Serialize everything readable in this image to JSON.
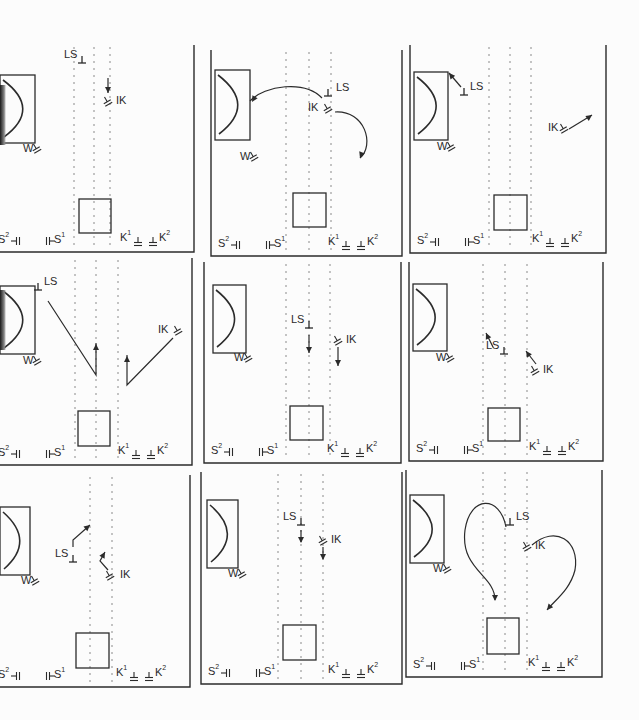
{
  "figure": {
    "panel_order": [
      "A",
      "B",
      "C",
      "D",
      "E",
      "F",
      "G",
      "H",
      "I"
    ]
  },
  "legend_labels": {
    "W": "W",
    "LS": "LS",
    "IK": "IK",
    "S1": "S",
    "S1_sup": "1",
    "S2": "S",
    "S2_sup": "2",
    "K1": "K",
    "K1_sup": "1",
    "K2": "K",
    "K2_sup": "2"
  },
  "panels": [
    {
      "id": "A",
      "x": -10,
      "y": 45,
      "w": 205,
      "h": 208,
      "goal_box": {
        "x": 10,
        "y": 30,
        "w": 35,
        "h": 68
      },
      "square": {
        "x": 89,
        "y": 154,
        "w": 32,
        "h": 34
      },
      "dotted_lines": [
        84,
        104,
        120
      ],
      "LS": {
        "x": 92,
        "y": 18,
        "label_dx": -18
      },
      "IK": {
        "x": 118,
        "y": 58,
        "label_dx": 8
      },
      "W": {
        "x": 35,
        "y": 105
      },
      "paths": [
        "M 118 33 L 118 48"
      ],
      "arrows": [
        [
          118,
          48,
          90
        ]
      ]
    },
    {
      "id": "B",
      "x": 210,
      "y": 50,
      "w": 193,
      "h": 207,
      "goal_box": {
        "x": 5,
        "y": 20,
        "w": 35,
        "h": 70
      },
      "square": {
        "x": 83,
        "y": 143,
        "w": 33,
        "h": 34
      },
      "dotted_lines": [
        76,
        99,
        121
      ],
      "LS": {
        "x": 118,
        "y": 46,
        "label_dx": 8
      },
      "IK": {
        "x": 118,
        "y": 60,
        "label_dx": -20
      },
      "W": {
        "x": 32,
        "y": 108
      },
      "paths": [
        "M 112 48 C 95 30, 55 35, 40 51",
        "M 125 62 C 155 60, 165 95, 150 108"
      ],
      "arrows": [
        [
          42,
          52,
          120
        ],
        [
          150,
          108,
          110
        ]
      ]
    },
    {
      "id": "C",
      "x": 409,
      "y": 45,
      "w": 198,
      "h": 209,
      "goal_box": {
        "x": 5,
        "y": 27,
        "w": 34,
        "h": 68
      },
      "square": {
        "x": 85,
        "y": 150,
        "w": 33,
        "h": 35
      },
      "dotted_lines": [
        80,
        101,
        122
      ],
      "LS": {
        "x": 55,
        "y": 50,
        "label_dx": 6
      },
      "IK": {
        "x": 155,
        "y": 85,
        "label_dx": -16
      },
      "W": {
        "x": 30,
        "y": 103
      },
      "paths": [
        "M 52 42 L 40 28",
        "M 160 84 L 183 70"
      ],
      "arrows": [
        [
          40,
          28,
          -130
        ],
        [
          183,
          70,
          -35
        ]
      ]
    },
    {
      "id": "D",
      "x": -10,
      "y": 258,
      "w": 203,
      "h": 208,
      "goal_box": {
        "x": 10,
        "y": 28,
        "w": 35,
        "h": 68
      },
      "square": {
        "x": 88,
        "y": 153,
        "w": 32,
        "h": 35
      },
      "dotted_lines": [
        85,
        106,
        128
      ],
      "LS": {
        "x": 48,
        "y": 32,
        "label_dx": 6
      },
      "IK": {
        "x": 188,
        "y": 74,
        "label_dx": -20
      },
      "W": {
        "x": 35,
        "y": 104
      },
      "paths": [
        "M 58 43 L 106 117 L 106 85",
        "M 183 80 L 137 127 L 137 97"
      ],
      "arrows": [
        [
          106,
          86,
          -90
        ],
        [
          137,
          98,
          -90
        ]
      ]
    },
    {
      "id": "E",
      "x": 203,
      "y": 262,
      "w": 199,
      "h": 202,
      "goal_box": {
        "x": 10,
        "y": 23,
        "w": 33,
        "h": 68
      },
      "square": {
        "x": 87,
        "y": 144,
        "w": 33,
        "h": 34
      },
      "dotted_lines": [
        83,
        106,
        127
      ],
      "LS": {
        "x": 106,
        "y": 66,
        "label_dx": -18
      },
      "IK": {
        "x": 135,
        "y": 80,
        "label_dx": 8
      },
      "W": {
        "x": 33,
        "y": 97
      },
      "paths": [
        "M 106 73 L 106 91",
        "M 135 85 L 135 104"
      ],
      "arrows": [
        [
          106,
          91,
          90
        ],
        [
          135,
          104,
          90
        ]
      ]
    },
    {
      "id": "F",
      "x": 408,
      "y": 262,
      "w": 196,
      "h": 200,
      "goal_box": {
        "x": 5,
        "y": 22,
        "w": 34,
        "h": 67
      },
      "square": {
        "x": 80,
        "y": 146,
        "w": 32,
        "h": 33
      },
      "dotted_lines": [
        75,
        97,
        119
      ],
      "LS": {
        "x": 96,
        "y": 92,
        "label_dx": -18
      },
      "IK": {
        "x": 127,
        "y": 110,
        "label_dx": 8
      },
      "W": {
        "x": 30,
        "y": 97
      },
      "paths": [
        "M 85 85 L 78 71",
        "M 128 102 L 118 89"
      ],
      "arrows": [
        [
          78,
          71,
          -115
        ],
        [
          118,
          89,
          -125
        ]
      ]
    },
    {
      "id": "G",
      "x": -10,
      "y": 475,
      "w": 201,
      "h": 213,
      "goal_box": {
        "x": 10,
        "y": 32,
        "w": 30,
        "h": 68
      },
      "square": {
        "x": 86,
        "y": 158,
        "w": 33,
        "h": 35
      },
      "dotted_lines": [
        100,
        122
      ],
      "LS": {
        "x": 83,
        "y": 87,
        "label_dx": -18
      },
      "IK": {
        "x": 120,
        "y": 102,
        "label_dx": 10
      },
      "W": {
        "x": 33,
        "y": 107
      },
      "paths": [
        "M 83 72 L 83 65 L 100 50",
        "M 118 95 L 110 86 L 115 77"
      ],
      "arrows": [
        [
          100,
          50,
          -40
        ],
        [
          115,
          77,
          -60
        ]
      ]
    },
    {
      "id": "H",
      "x": 200,
      "y": 472,
      "w": 203,
      "h": 213,
      "goal_box": {
        "x": 7,
        "y": 28,
        "w": 31,
        "h": 68
      },
      "square": {
        "x": 83,
        "y": 153,
        "w": 33,
        "h": 35
      },
      "dotted_lines": [
        78,
        101,
        123
      ],
      "LS": {
        "x": 101,
        "y": 53,
        "label_dx": -18
      },
      "IK": {
        "x": 123,
        "y": 70,
        "label_dx": 8
      },
      "W": {
        "x": 30,
        "y": 103
      },
      "paths": [
        "M 101 58 L 101 70",
        "M 123 75 L 123 87"
      ],
      "arrows": [
        [
          101,
          71,
          90
        ],
        [
          123,
          88,
          90
        ]
      ]
    },
    {
      "id": "I",
      "x": 405,
      "y": 470,
      "w": 198,
      "h": 208,
      "goal_box": {
        "x": 5,
        "y": 25,
        "w": 34,
        "h": 68
      },
      "square": {
        "x": 82,
        "y": 148,
        "w": 32,
        "h": 36
      },
      "dotted_lines": [
        78,
        100,
        122
      ],
      "LS": {
        "x": 105,
        "y": 55,
        "label_dx": 6
      },
      "IK": {
        "x": 122,
        "y": 78,
        "label_dx": 8
      },
      "W": {
        "x": 30,
        "y": 100
      },
      "paths": [
        "M 101 57 C 95 25, 65 25, 60 60 C 55 100, 90 105, 90 130",
        "M 127 75 C 150 55, 175 70, 170 100 C 165 120, 150 130, 142 140"
      ],
      "arrows": [
        [
          90,
          131,
          90
        ],
        [
          142,
          140,
          130
        ]
      ]
    }
  ]
}
